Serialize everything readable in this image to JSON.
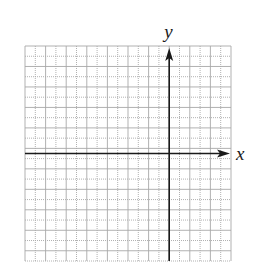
{
  "chart_data": {
    "type": "coordinate-grid",
    "title": "",
    "xlabel": "x",
    "ylabel": "y",
    "grid": true,
    "columns": 20,
    "rows": 21,
    "y_axis_column": 14,
    "x_axis_row": 10.5,
    "x_arrow": "right",
    "y_arrow": "up",
    "tick_labels": [],
    "series": []
  },
  "colors": {
    "grid": "#a8a8a8",
    "axis": "#1a1a1a",
    "background": "#ffffff"
  }
}
